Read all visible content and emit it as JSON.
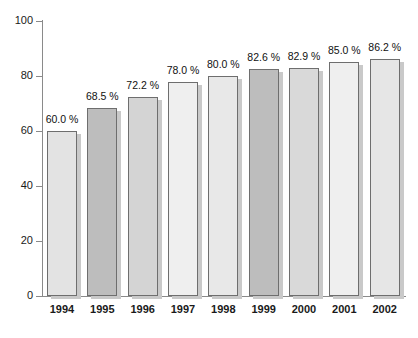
{
  "chart_data": {
    "type": "bar",
    "title": "",
    "subtitle": "",
    "xlabel": "",
    "ylabel": "",
    "categories": [
      "1994",
      "1995",
      "1996",
      "1997",
      "1998",
      "1999",
      "2000",
      "2001",
      "2002"
    ],
    "values": [
      60.0,
      68.5,
      72.2,
      78.0,
      80.0,
      82.6,
      82.9,
      85.0,
      86.2
    ],
    "data_labels": [
      "60.0 %",
      "68.5 %",
      "72.2 %",
      "78.0 %",
      "80.0 %",
      "82.6 %",
      "82.9 %",
      "85.0 %",
      "86.2 %"
    ],
    "ylim": [
      0,
      100
    ],
    "y_ticks": [
      0,
      20,
      40,
      60,
      80,
      100
    ],
    "y_tick_labels": [
      "0",
      "20",
      "40",
      "60",
      "80",
      "100"
    ],
    "grid": false,
    "legend": null,
    "bar_colors": [
      "#e3e3e3",
      "#bdbdbd",
      "#d4d4d4",
      "#efefef",
      "#e8e8e8",
      "#bdbdbd",
      "#d9d9d9",
      "#efefef",
      "#e6e6e6"
    ],
    "bar_border_color": "#6e6e6e",
    "bar_shadow_color": "#c9c9c9",
    "axis_color": "#8a8a8a",
    "background_color": "#ffffff",
    "text_color": "#111111"
  }
}
